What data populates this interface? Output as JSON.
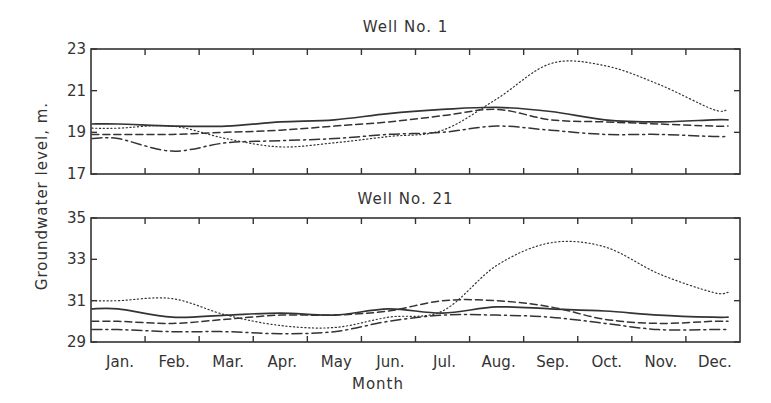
{
  "chart_data": [
    {
      "type": "line",
      "title": "Well No. 1",
      "xlabel": "Month",
      "ylabel": "Groundwater level, m.",
      "categories": [
        "Jan.",
        "Feb.",
        "Mar.",
        "Apr.",
        "May",
        "Jun.",
        "Jul.",
        "Aug.",
        "Sep.",
        "Oct.",
        "Nov.",
        "Dec."
      ],
      "ylim": [
        17,
        23
      ],
      "yticks": [
        17,
        19,
        21,
        23
      ],
      "grid": false,
      "legend": null,
      "series": [
        {
          "name": "solid",
          "style": "solid",
          "values": [
            19.4,
            19.3,
            19.3,
            19.5,
            19.6,
            19.9,
            20.1,
            20.2,
            20.0,
            19.6,
            19.5,
            19.6
          ]
        },
        {
          "name": "dashed",
          "style": "dashed",
          "values": [
            18.9,
            18.9,
            19.0,
            19.1,
            19.3,
            19.5,
            19.8,
            20.1,
            19.6,
            19.5,
            19.4,
            19.3
          ]
        },
        {
          "name": "dash-dot",
          "style": "dashdot",
          "values": [
            18.7,
            18.1,
            18.5,
            18.6,
            18.7,
            18.9,
            19.0,
            19.3,
            19.1,
            18.9,
            18.9,
            18.8
          ]
        },
        {
          "name": "dotted",
          "style": "dotted",
          "values": [
            19.2,
            19.3,
            18.7,
            18.3,
            18.5,
            18.8,
            19.1,
            20.6,
            22.3,
            22.2,
            21.3,
            20.1
          ]
        }
      ]
    },
    {
      "type": "line",
      "title": "Well No. 21",
      "xlabel": "Month",
      "ylabel": "Groundwater level, m.",
      "categories": [
        "Jan.",
        "Feb.",
        "Mar.",
        "Apr.",
        "May",
        "Jun.",
        "Jul.",
        "Aug.",
        "Sep.",
        "Oct.",
        "Nov.",
        "Dec."
      ],
      "ylim": [
        29,
        35
      ],
      "yticks": [
        29,
        31,
        33,
        35
      ],
      "grid": false,
      "legend": null,
      "series": [
        {
          "name": "solid",
          "style": "solid",
          "values": [
            30.6,
            30.2,
            30.3,
            30.4,
            30.3,
            30.6,
            30.4,
            30.7,
            30.6,
            30.5,
            30.3,
            30.2
          ]
        },
        {
          "name": "dashed",
          "style": "dashed",
          "values": [
            30.0,
            29.9,
            30.1,
            30.3,
            30.3,
            30.5,
            31.0,
            31.0,
            30.7,
            30.1,
            29.9,
            30.0
          ]
        },
        {
          "name": "dash-dot",
          "style": "dashdot",
          "values": [
            29.6,
            29.5,
            29.5,
            29.4,
            29.5,
            30.0,
            30.3,
            30.3,
            30.2,
            29.9,
            29.6,
            29.6
          ]
        },
        {
          "name": "dotted",
          "style": "dotted",
          "values": [
            31.0,
            31.1,
            30.3,
            29.8,
            29.7,
            30.2,
            30.5,
            32.7,
            33.8,
            33.6,
            32.3,
            31.4
          ]
        }
      ]
    }
  ],
  "labels": {
    "panel1_title": "Well No. 1",
    "panel2_title": "Well No. 21",
    "xlabel": "Month",
    "ylabel": "Groundwater level, m."
  }
}
